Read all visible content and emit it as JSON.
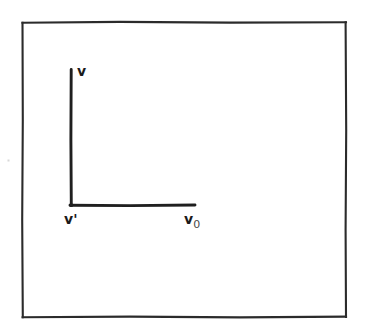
{
  "figure": {
    "type": "line-diagram",
    "background_color": "#ffffff",
    "ink_color": "#1a1a1a",
    "frame": {
      "name": "outer-border-rectangle",
      "left": 22,
      "top": 22,
      "right": 346,
      "bottom": 317,
      "stroke_width": 2
    },
    "axes": {
      "vertical_line": {
        "name": "vertical-axis-line",
        "x": 71,
        "y_top": 69,
        "y_bottom": 206,
        "stroke_width": 3
      },
      "horizontal_line": {
        "name": "horizontal-axis-line",
        "y": 205,
        "x_left": 70,
        "x_right": 195,
        "stroke_width": 3
      },
      "corner": {
        "name": "axis-corner-vertex",
        "x": 71,
        "y": 205
      }
    },
    "labels": [
      {
        "id": "label-v",
        "name": "label-v",
        "text": "v",
        "subscript": "",
        "prime": false,
        "x": 77,
        "y": 64,
        "anchor": "top-of-vertical-axis"
      },
      {
        "id": "label-v-prime",
        "name": "label-v-prime",
        "text": "v",
        "subscript": "",
        "prime": true,
        "prime_glyph": "'",
        "x": 64,
        "y": 212,
        "anchor": "below-axis-corner"
      },
      {
        "id": "label-v-zero",
        "name": "label-v-zero",
        "text": "v",
        "subscript": "0",
        "prime": false,
        "x": 184,
        "y": 212,
        "anchor": "below-right-end-of-horizontal-axis"
      }
    ]
  }
}
